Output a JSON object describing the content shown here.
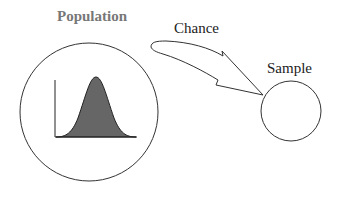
{
  "diagram": {
    "population_label": "Population",
    "chance_label": "Chance",
    "sample_label": "Sample",
    "colors": {
      "population_label": "#777777",
      "text": "#222222",
      "stroke": "#333333",
      "distribution_fill": "#666666",
      "background": "#ffffff"
    },
    "icons": {
      "distribution": "normal-curve",
      "arrow": "curved-block-arrow"
    }
  }
}
